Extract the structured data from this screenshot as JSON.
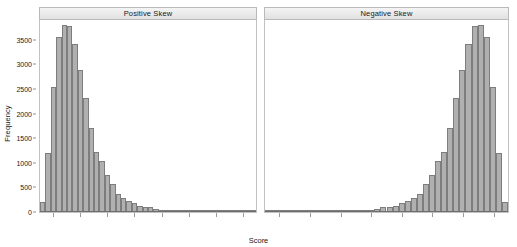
{
  "chart_data": {
    "type": "bar",
    "subtype": "histogram-facet",
    "title": "",
    "xlabel": "Score",
    "ylabel": "Frequency",
    "ylim": [
      0,
      3900
    ],
    "yticks": [
      0,
      500,
      1000,
      1500,
      2000,
      2500,
      3000,
      3500
    ],
    "ytick_labels": [
      "0",
      "500",
      "1000",
      "1500",
      "2000",
      "2500",
      "3000",
      "3500"
    ],
    "xticks_labeled": false,
    "xtick_count": 8,
    "grid": false,
    "legend": "none",
    "bar_fill": "#b0b0b0",
    "bar_edge": "#7d7d7d",
    "strip_fill": "#ebebeb",
    "panel_border": "#c2c2c2",
    "panels": [
      {
        "label": "Positive Skew",
        "orientation": "right-tailed",
        "values": [
          195,
          1200,
          2540,
          3560,
          3800,
          3780,
          3420,
          2880,
          2310,
          1700,
          1220,
          1040,
          760,
          565,
          375,
          290,
          215,
          185,
          120,
          105,
          95,
          60,
          45,
          40,
          32,
          26,
          20,
          16,
          13,
          10,
          8,
          7,
          6,
          5,
          4,
          4,
          3,
          3,
          2,
          2
        ]
      },
      {
        "label": "Negative Skew",
        "orientation": "left-tailed",
        "values": [
          2,
          2,
          3,
          3,
          4,
          4,
          5,
          6,
          7,
          8,
          10,
          13,
          16,
          20,
          26,
          32,
          40,
          45,
          60,
          95,
          105,
          120,
          185,
          215,
          290,
          375,
          565,
          760,
          1040,
          1220,
          1700,
          2310,
          2880,
          3420,
          3780,
          3800,
          3560,
          2540,
          1200,
          195
        ]
      }
    ]
  }
}
